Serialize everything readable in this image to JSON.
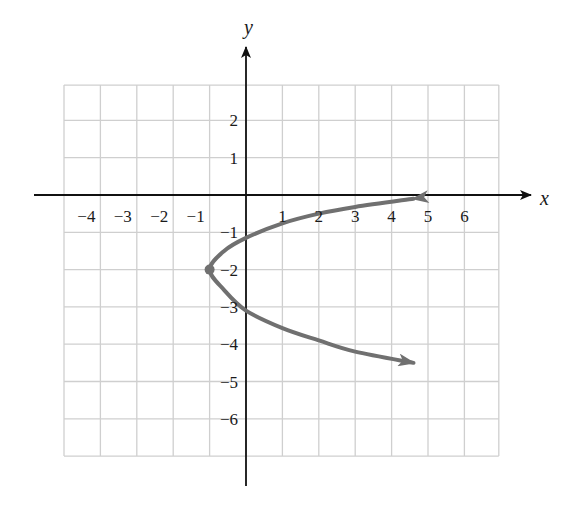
{
  "chart_data": {
    "type": "line",
    "title": "",
    "xlabel": "x",
    "ylabel": "y",
    "xlim": [
      -5,
      7
    ],
    "ylim": [
      -7,
      3
    ],
    "grid": true,
    "x_ticks": [
      {
        "value": -4,
        "label": "−4"
      },
      {
        "value": -3,
        "label": "−3"
      },
      {
        "value": -2,
        "label": "−2"
      },
      {
        "value": -1,
        "label": "−1"
      },
      {
        "value": 1,
        "label": "1"
      },
      {
        "value": 2,
        "label": "2"
      },
      {
        "value": 3,
        "label": "3"
      },
      {
        "value": 4,
        "label": "4"
      },
      {
        "value": 5,
        "label": "5"
      },
      {
        "value": 6,
        "label": "6"
      }
    ],
    "y_ticks": [
      {
        "value": 2,
        "label": "2"
      },
      {
        "value": 1,
        "label": "1"
      },
      {
        "value": -1,
        "label": "−1"
      },
      {
        "value": -2,
        "label": "−2"
      },
      {
        "value": -3,
        "label": "−3"
      },
      {
        "value": -4,
        "label": "−4"
      },
      {
        "value": -5,
        "label": "−5"
      },
      {
        "value": -6,
        "label": "−6"
      }
    ],
    "series": [
      {
        "name": "parabola opening right",
        "color": "#707070",
        "vertex": {
          "x": -1,
          "y": -2
        },
        "arrows_at_ends": true,
        "points": [
          {
            "x": 4.6,
            "y": -0.1
          },
          {
            "x": 3,
            "y": -0.32
          },
          {
            "x": 2,
            "y": -0.5
          },
          {
            "x": 1,
            "y": -0.76
          },
          {
            "x": 0,
            "y": -1.15
          },
          {
            "x": -0.6,
            "y": -1.5
          },
          {
            "x": -1,
            "y": -2
          },
          {
            "x": -0.6,
            "y": -2.55
          },
          {
            "x": 0,
            "y": -3.1
          },
          {
            "x": 1,
            "y": -3.57
          },
          {
            "x": 2,
            "y": -3.9
          },
          {
            "x": 3,
            "y": -4.2
          },
          {
            "x": 4.6,
            "y": -4.5
          }
        ]
      }
    ]
  },
  "colors": {
    "grid": "#cfcfcf",
    "axis": "#111111",
    "curve": "#707070",
    "background": "#ffffff"
  }
}
